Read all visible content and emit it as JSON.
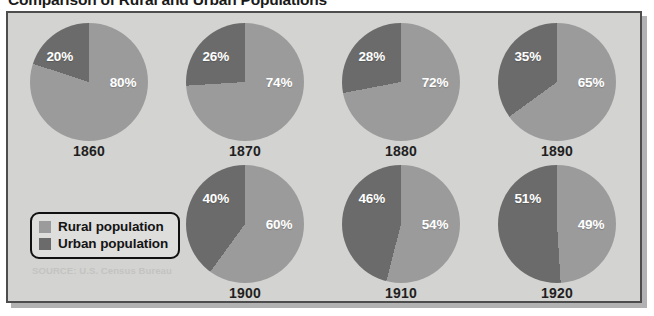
{
  "title": "Comparison of Rural and Urban Populations",
  "source_note": "SOURCE: U.S. Census Bureau",
  "colors": {
    "rural": "#9b9b9b",
    "urban": "#6b6b6b",
    "panel_background": "#d3d3d1",
    "panel_border": "#4d4d4d",
    "label_text": "#ffffff",
    "year_text": "#1f1f1f"
  },
  "legend": {
    "items": [
      {
        "label": "Rural population",
        "color": "#9b9b9b",
        "swatch": "rural-swatch"
      },
      {
        "label": "Urban population",
        "color": "#6b6b6b",
        "swatch": "urban-swatch"
      }
    ]
  },
  "chart_data": {
    "type": "pie",
    "title": "Comparison of Rural and Urban Populations",
    "subtitle": "",
    "xlabel": "",
    "ylabel": "",
    "legend_position": "bottom-left",
    "grid": false,
    "units": "percent",
    "categories": [
      "Rural population",
      "Urban population"
    ],
    "series_colors": [
      "#9b9b9b",
      "#6b6b6b"
    ],
    "panels": [
      {
        "year": "1860",
        "rural_label": "80%",
        "urban_label": "20%",
        "rural": 80,
        "urban": 20
      },
      {
        "year": "1870",
        "rural_label": "74%",
        "urban_label": "26%",
        "rural": 74,
        "urban": 26
      },
      {
        "year": "1880",
        "rural_label": "72%",
        "urban_label": "28%",
        "rural": 72,
        "urban": 28
      },
      {
        "year": "1890",
        "rural_label": "65%",
        "urban_label": "35%",
        "rural": 65,
        "urban": 35
      },
      {
        "year": "1900",
        "rural_label": "60%",
        "urban_label": "40%",
        "rural": 60,
        "urban": 40
      },
      {
        "year": "1910",
        "rural_label": "54%",
        "urban_label": "46%",
        "rural": 54,
        "urban": 46
      },
      {
        "year": "1920",
        "rural_label": "49%",
        "urban_label": "51%",
        "rural": 49,
        "urban": 51
      }
    ]
  }
}
